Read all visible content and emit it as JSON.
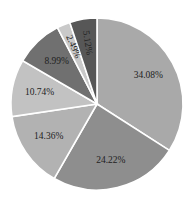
{
  "chart_data": {
    "type": "pie",
    "title": "",
    "start_angle": "12 o'clock",
    "direction": "clockwise",
    "slices": [
      {
        "label": "34.08%",
        "value": 34.08,
        "color": "#a9a9a9"
      },
      {
        "label": "24.22%",
        "value": 24.22,
        "color": "#8e8e8e"
      },
      {
        "label": "14.36%",
        "value": 14.36,
        "color": "#b2b2b2"
      },
      {
        "label": "10.74%",
        "value": 10.74,
        "color": "#c2c2c2"
      },
      {
        "label": "8.99%",
        "value": 8.99,
        "color": "#707070"
      },
      {
        "label": "2.49%",
        "value": 2.49,
        "color": "#c9c9c9"
      },
      {
        "label": "5.12%",
        "value": 5.12,
        "color": "#575757"
      }
    ],
    "legend": []
  }
}
